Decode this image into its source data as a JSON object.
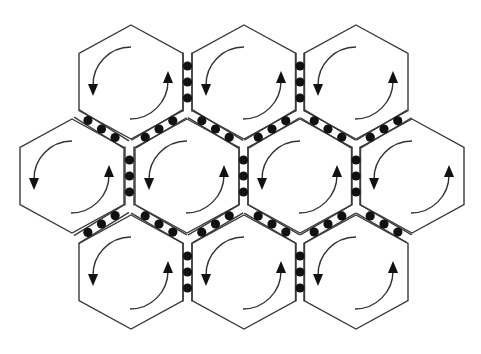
{
  "diagram": {
    "type": "hexagonal-cell-array",
    "colors": {
      "background": "#ffffff",
      "outline": "#3a3a3a",
      "dot": "#111111",
      "arrow": "#333333"
    },
    "hex": {
      "circumradius": 57,
      "half_width": 52
    },
    "rows": [
      {
        "name": "top",
        "cy": 82,
        "cx": [
          131,
          244,
          356
        ]
      },
      {
        "name": "middle",
        "cy": 176,
        "cx": [
          72,
          187,
          300,
          412
        ]
      },
      {
        "name": "bottom",
        "cy": 272,
        "cx": [
          131,
          244,
          356
        ]
      }
    ],
    "cell_rotation": "counterclockwise",
    "dots_per_channel": 3
  }
}
